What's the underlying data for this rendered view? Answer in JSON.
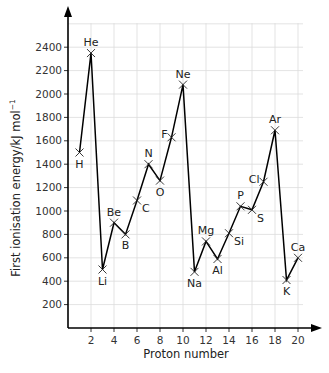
{
  "chart_data": {
    "type": "line",
    "title": "",
    "xlabel": "Proton number",
    "ylabel": "First ionisation energy/kJ mol",
    "ylabel_superscript": "−1",
    "xlim": [
      0,
      21
    ],
    "ylim": [
      0,
      2600
    ],
    "grid": true,
    "x_ticks": [
      2,
      4,
      6,
      8,
      10,
      12,
      14,
      16,
      18,
      20
    ],
    "y_ticks": [
      200,
      400,
      600,
      800,
      1000,
      1200,
      1400,
      1600,
      1800,
      2000,
      2200,
      2400
    ],
    "x": [
      1,
      2,
      3,
      4,
      5,
      6,
      7,
      8,
      9,
      10,
      11,
      12,
      13,
      14,
      15,
      16,
      17,
      18,
      19,
      20
    ],
    "labels": [
      "H",
      "He",
      "Li",
      "Be",
      "B",
      "C",
      "N",
      "O",
      "F",
      "Ne",
      "Na",
      "Mg",
      "Al",
      "Si",
      "P",
      "S",
      "Cl",
      "Ar",
      "K",
      "Ca"
    ],
    "values": [
      1500,
      2350,
      500,
      900,
      800,
      1090,
      1400,
      1260,
      1630,
      2080,
      480,
      740,
      590,
      810,
      1040,
      1010,
      1250,
      1690,
      410,
      600
    ],
    "label_positions": [
      "below",
      "above",
      "below",
      "above",
      "below",
      "right",
      "above",
      "below",
      "left",
      "above",
      "below",
      "above",
      "below",
      "right",
      "above",
      "right",
      "left",
      "above",
      "below",
      "above"
    ],
    "marker": "x",
    "colors": {
      "line": "#000000",
      "grid": "#dcdcdc",
      "text": "#222222"
    }
  }
}
